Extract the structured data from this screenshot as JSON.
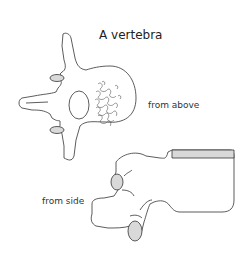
{
  "diagram": {
    "title": "A vertebra",
    "views": [
      {
        "label": "from above"
      },
      {
        "label": "from side"
      }
    ],
    "colors": {
      "outline": "#333333",
      "shading": "#d9d9d9",
      "background": "#ffffff"
    }
  }
}
